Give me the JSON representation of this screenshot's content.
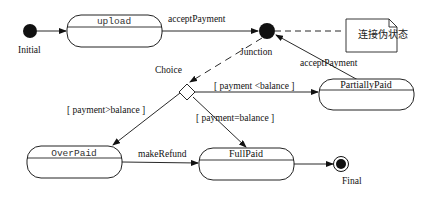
{
  "diagram": {
    "type": "UML state machine",
    "pseudostates": {
      "initial": {
        "label": "Initial"
      },
      "junction": {
        "label": "Junction"
      },
      "choice": {
        "label": "Choice"
      },
      "final": {
        "label": "Final"
      }
    },
    "states": {
      "upload": {
        "name": "upload"
      },
      "partially_paid": {
        "name": "PartiallyPaid"
      },
      "over_paid": {
        "name": "OverPaid"
      },
      "full_paid": {
        "name": "FullPaid"
      }
    },
    "transitions": {
      "upload_to_junction": "acceptPayment",
      "partially_paid_to_junction": "acceptPayment",
      "choice_to_partially_paid": "[ payment <balance ]",
      "choice_to_over_paid": "[ payment>balance ]",
      "choice_to_full_paid": "[ payment=balance ]",
      "over_paid_to_full_paid": "makeRefund"
    },
    "note": {
      "text": "连接伪状态"
    }
  }
}
